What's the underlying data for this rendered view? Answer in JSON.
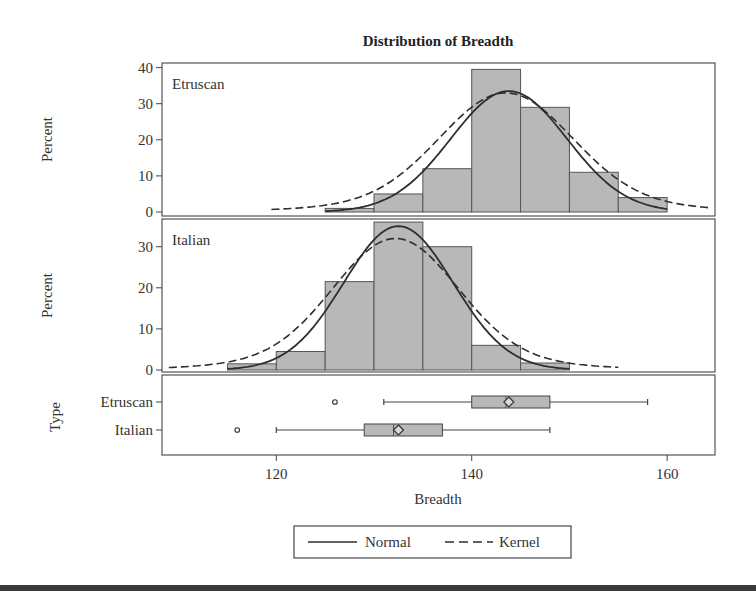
{
  "chart_data": {
    "type": "histogram-panel",
    "title": "Distribution of Breadth",
    "xlabel": "Breadth",
    "xlim": [
      108.3,
      164.9
    ],
    "xticks": [
      120,
      140,
      160
    ],
    "bin_width": 5,
    "colors": {
      "bar_fill": "#b8b8b8",
      "bar_stroke": "#555555",
      "curve": "#2e2e2e",
      "frame": "#555555"
    },
    "panels": [
      {
        "label": "Etruscan",
        "ylabel": "Percent",
        "ylim": [
          0,
          41
        ],
        "yticks": [
          0,
          10,
          20,
          30,
          40
        ],
        "bins": [
          {
            "start": 125,
            "end": 130,
            "percent": 1
          },
          {
            "start": 130,
            "end": 135,
            "percent": 5
          },
          {
            "start": 135,
            "end": 140,
            "percent": 12
          },
          {
            "start": 140,
            "end": 145,
            "percent": 39.5
          },
          {
            "start": 145,
            "end": 150,
            "percent": 29
          },
          {
            "start": 150,
            "end": 155,
            "percent": 11
          },
          {
            "start": 155,
            "end": 160,
            "percent": 4
          }
        ],
        "normal": {
          "mean": 143.8,
          "sd": 5.95,
          "peak": 33.5,
          "x_range": [
            125,
            160
          ]
        },
        "kernel": {
          "peak": 33,
          "center": 143.5,
          "x_range": [
            119.5,
            164.5
          ]
        }
      },
      {
        "label": "Italian",
        "ylabel": "Percent",
        "ylim": [
          0,
          36.5
        ],
        "yticks": [
          0,
          10,
          20,
          30
        ],
        "bins": [
          {
            "start": 115,
            "end": 120,
            "percent": 1.5
          },
          {
            "start": 120,
            "end": 125,
            "percent": 4.5
          },
          {
            "start": 125,
            "end": 130,
            "percent": 21.5
          },
          {
            "start": 130,
            "end": 135,
            "percent": 36
          },
          {
            "start": 135,
            "end": 140,
            "percent": 30
          },
          {
            "start": 140,
            "end": 145,
            "percent": 6
          },
          {
            "start": 145,
            "end": 150,
            "percent": 1.7
          }
        ],
        "normal": {
          "mean": 132.5,
          "sd": 5.6,
          "peak": 35,
          "x_range": [
            115,
            150
          ]
        },
        "kernel": {
          "peak": 32,
          "center": 132.2,
          "x_range": [
            109,
            155
          ]
        }
      }
    ],
    "boxplot": {
      "ylabel": "Type",
      "categories": [
        "Etruscan",
        "Italian"
      ],
      "series": [
        {
          "name": "Etruscan",
          "whisker_low": 131,
          "q1": 140,
          "median": 143.5,
          "q3": 148,
          "whisker_high": 158,
          "mean": 143.8,
          "outliers": [
            126
          ]
        },
        {
          "name": "Italian",
          "whisker_low": 120,
          "q1": 129,
          "median": 132,
          "q3": 137,
          "whisker_high": 148,
          "mean": 132.5,
          "outliers": [
            116
          ]
        }
      ]
    },
    "legend": {
      "position": "bottom",
      "entries": [
        {
          "label": "Normal",
          "style": "solid"
        },
        {
          "label": "Kernel",
          "style": "dashed"
        }
      ]
    }
  }
}
